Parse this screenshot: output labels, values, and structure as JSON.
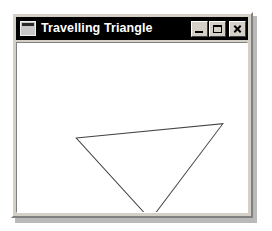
{
  "window": {
    "title": "Travelling Triangle",
    "icon": "window-icon",
    "title_bar_color": "#000000",
    "title_text_color": "#ffffff",
    "frame_color": "#d4d0c8",
    "client_background": "#ffffff"
  },
  "caption_buttons": [
    {
      "name": "minimize",
      "glyph": "_",
      "label": "Minimize"
    },
    {
      "name": "maximize",
      "glyph": "□",
      "label": "Maximize"
    },
    {
      "name": "close",
      "glyph": "✕",
      "label": "Close"
    }
  ],
  "canvas": {
    "name": "triangle-canvas",
    "width": 229,
    "height": 176,
    "background": "#ffffff",
    "shapes": [
      {
        "type": "polygon",
        "name": "travelling-triangle",
        "stroke": "#444444",
        "stroke_width": 1,
        "fill": "none",
        "points": "59,99 205,84 133,184"
      }
    ]
  }
}
